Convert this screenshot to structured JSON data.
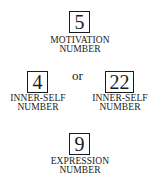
{
  "diagram": {
    "motivation": {
      "value": "5",
      "label_line1": "MOTIVATION",
      "label_line2": "NUMBER"
    },
    "inner_self_left": {
      "value": "4",
      "label_line1": "INNER-SELF",
      "label_line2": "NUMBER"
    },
    "connector": "or",
    "inner_self_right": {
      "value": "22",
      "label_line1": "INNER-SELF",
      "label_line2": "NUMBER"
    },
    "expression": {
      "value": "9",
      "label_line1": "EXPRESSION",
      "label_line2": "NUMBER"
    }
  }
}
